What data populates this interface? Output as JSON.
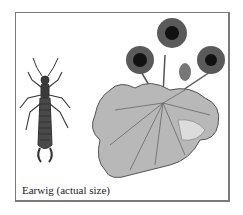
{
  "figure": {
    "caption": "Earwig (actual size)",
    "subjects": [
      "earwig",
      "flowering plant with leaf"
    ],
    "colors": {
      "border": "#7a7a7a",
      "insect": "#3a3a3a",
      "leaf_fill": "#b8b8b8",
      "leaf_vein": "#555555",
      "flower_petal": "#5a5a5a",
      "flower_center": "#111111"
    }
  }
}
